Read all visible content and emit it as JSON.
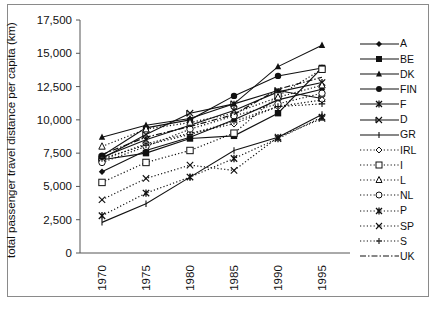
{
  "chart_data": {
    "type": "line",
    "title": "",
    "xlabel": "",
    "ylabel": "total passenger travel distance per capita (km)",
    "x": [
      "1970",
      "1975",
      "1980",
      "1985",
      "1990",
      "1995"
    ],
    "yticks": [
      "0",
      "2,500",
      "5,000",
      "7,500",
      "10,000",
      "12,500",
      "15,000",
      "17,500"
    ],
    "ylim": [
      0,
      17500
    ],
    "grid": false,
    "legend_position": "right",
    "series": [
      {
        "name": "A",
        "marker": "diamond-filled",
        "line": "solid",
        "values": [
          6100,
          7700,
          8700,
          10000,
          11500,
          12300
        ]
      },
      {
        "name": "BE",
        "marker": "square-filled",
        "line": "solid",
        "values": [
          7000,
          7500,
          8600,
          8800,
          10500,
          13900
        ]
      },
      {
        "name": "DK",
        "marker": "triangle-filled",
        "line": "solid",
        "values": [
          8700,
          9600,
          10100,
          11200,
          14000,
          15600
        ]
      },
      {
        "name": "FIN",
        "marker": "circle-filled",
        "line": "solid",
        "values": [
          7300,
          9400,
          10000,
          11800,
          13300,
          13900
        ]
      },
      {
        "name": "F",
        "marker": "asterisk",
        "line": "solid",
        "values": [
          7200,
          8500,
          9600,
          10700,
          12100,
          12800
        ]
      },
      {
        "name": "D",
        "marker": "x-bar",
        "line": "solid",
        "values": [
          7100,
          8900,
          10500,
          11200,
          12200,
          11600
        ]
      },
      {
        "name": "GR",
        "marker": "bar",
        "line": "solid",
        "values": [
          2300,
          3700,
          5700,
          7700,
          8700,
          10400
        ]
      },
      {
        "name": "IRL",
        "marker": "diamond-open",
        "line": "dotted",
        "values": [
          7000,
          8200,
          9000,
          9700,
          11000,
          11500
        ]
      },
      {
        "name": "I",
        "marker": "square-open",
        "line": "dotted",
        "values": [
          5300,
          6800,
          7700,
          9000,
          11800,
          13800
        ]
      },
      {
        "name": "L",
        "marker": "triangle-open",
        "line": "dotted",
        "values": [
          8000,
          9300,
          9800,
          10500,
          11700,
          12600
        ]
      },
      {
        "name": "NL",
        "marker": "circle-open",
        "line": "dotted",
        "values": [
          6800,
          8000,
          9300,
          10300,
          11200,
          12000
        ]
      },
      {
        "name": "P",
        "marker": "asterisk",
        "line": "dotted",
        "values": [
          2800,
          4500,
          5700,
          7100,
          8600,
          10200
        ]
      },
      {
        "name": "SP",
        "marker": "x",
        "line": "dotted",
        "values": [
          4000,
          5600,
          6600,
          6200,
          8700,
          10100
        ]
      },
      {
        "name": "S",
        "marker": "plus",
        "line": "dotted",
        "values": [
          7100,
          8100,
          8900,
          9900,
          11000,
          11200
        ]
      },
      {
        "name": "UK",
        "marker": "none",
        "line": "dashdot",
        "values": [
          7400,
          8700,
          9500,
          10400,
          12300,
          13200
        ]
      }
    ]
  },
  "legend": {
    "items": [
      "A",
      "BE",
      "DK",
      "FIN",
      "F",
      "D",
      "GR",
      "IRL",
      "I",
      "L",
      "NL",
      "P",
      "SP",
      "S",
      "UK"
    ]
  }
}
